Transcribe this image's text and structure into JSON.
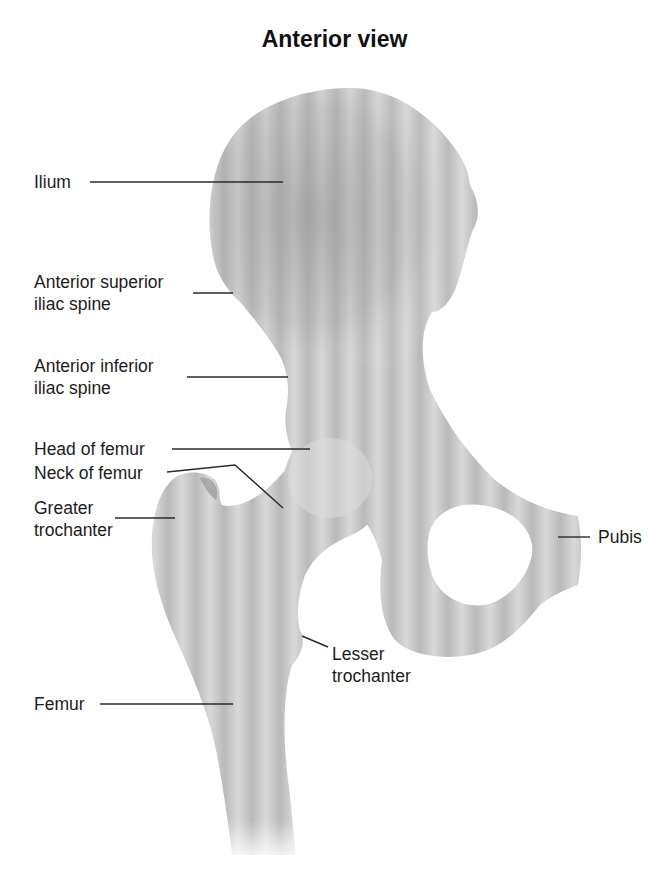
{
  "title": "Anterior view",
  "labels": [
    {
      "id": "ilium",
      "lines": [
        "Ilium"
      ]
    },
    {
      "id": "asis",
      "lines": [
        "Anterior superior",
        "iliac spine"
      ]
    },
    {
      "id": "aiis",
      "lines": [
        "Anterior inferior",
        "iliac spine"
      ]
    },
    {
      "id": "head-femur",
      "lines": [
        "Head of femur"
      ]
    },
    {
      "id": "neck-femur",
      "lines": [
        "Neck of femur"
      ]
    },
    {
      "id": "greater-trochanter",
      "lines": [
        "Greater",
        "trochanter"
      ]
    },
    {
      "id": "pubis",
      "lines": [
        "Pubis"
      ]
    },
    {
      "id": "lesser-trochanter",
      "lines": [
        "Lesser",
        "trochanter"
      ]
    },
    {
      "id": "femur",
      "lines": [
        "Femur"
      ]
    }
  ],
  "colors": {
    "bone_light": "#e6e6e6",
    "bone_mid": "#c4c4c4",
    "bone_dark": "#a3a3a3",
    "leader_line": "#2a2a2a"
  }
}
